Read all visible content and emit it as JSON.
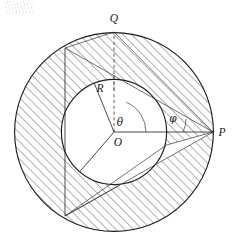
{
  "figure": {
    "type": "geometry-diagram",
    "canvas": {
      "width": 236,
      "height": 244,
      "background": "#ffffff"
    },
    "ink_color": "#1b1b20",
    "hatch_color": "#3c3c44",
    "labels": {
      "Q": "Q",
      "P": "P",
      "R": "R",
      "O": "O",
      "theta": "θ",
      "phi": "φ"
    },
    "label_positions": {
      "Q": {
        "x": 114,
        "y": 22
      },
      "P": {
        "x": 222,
        "y": 136
      },
      "R": {
        "x": 100,
        "y": 92
      },
      "O": {
        "x": 118,
        "y": 146
      },
      "theta": {
        "x": 120,
        "y": 126
      },
      "phi": {
        "x": 173,
        "y": 122
      }
    },
    "geometry": {
      "center": {
        "x": 114,
        "y": 132
      },
      "outer_radius": 100,
      "inner_radius": 53,
      "points": {
        "O": {
          "x": 114,
          "y": 132
        },
        "P": {
          "x": 213,
          "y": 132
        },
        "Q": {
          "x": 114,
          "y": 32
        },
        "A": {
          "x": 65,
          "y": 48
        },
        "B": {
          "x": 65,
          "y": 216
        }
      },
      "angles": {
        "theta_deg": 68,
        "phi_deg": 24
      }
    },
    "elements": [
      {
        "name": "outer-circle",
        "kind": "circle"
      },
      {
        "name": "inner-circle",
        "kind": "circle"
      },
      {
        "name": "annulus-hatching",
        "kind": "hatch-region"
      },
      {
        "name": "chord-AB",
        "kind": "line"
      },
      {
        "name": "segment-OP",
        "kind": "line"
      },
      {
        "name": "segment-OQ-dashed",
        "kind": "dashed-line"
      },
      {
        "name": "radius-R-line",
        "kind": "line"
      },
      {
        "name": "angle-arc-theta",
        "kind": "arc"
      },
      {
        "name": "angle-arc-phi",
        "kind": "arc"
      },
      {
        "name": "tangent-lines-from-P",
        "kind": "lines"
      }
    ]
  }
}
